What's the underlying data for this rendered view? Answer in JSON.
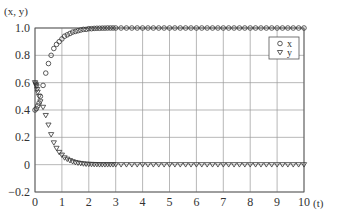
{
  "chart_data": {
    "type": "scatter",
    "title": "",
    "xlabel": "(t)",
    "ylabel": "(x, y)",
    "xlim": [
      0,
      10
    ],
    "ylim": [
      -0.2,
      1.0
    ],
    "grid": true,
    "legend_position": "upper right",
    "x_ticks": [
      "0",
      "1",
      "2",
      "3",
      "4",
      "5",
      "6",
      "7",
      "8",
      "9",
      "10"
    ],
    "y_ticks": [
      "-0.2",
      "0",
      "0.2",
      "0.4",
      "0.6",
      "0.8",
      "1.0"
    ],
    "series": [
      {
        "name": "x",
        "marker": "circle",
        "x": [
          0,
          0.05,
          0.1,
          0.15,
          0.2,
          0.3,
          0.4,
          0.5,
          0.6,
          0.7,
          0.8,
          0.9,
          1.0,
          1.1,
          1.2,
          1.3,
          1.4,
          1.5,
          1.6,
          1.7,
          1.8,
          1.9,
          2.0,
          2.1,
          2.2,
          2.3,
          2.4,
          2.5,
          2.6,
          2.7,
          2.8,
          2.9,
          3.0,
          3.2,
          3.4,
          3.6,
          3.8,
          4.0,
          4.2,
          4.4,
          4.6,
          4.8,
          5.0,
          5.2,
          5.4,
          5.6,
          5.8,
          6.0,
          6.2,
          6.4,
          6.6,
          6.8,
          7.0,
          7.2,
          7.4,
          7.6,
          7.8,
          8.0,
          8.2,
          8.4,
          8.6,
          8.8,
          9.0,
          9.2,
          9.4,
          9.6,
          9.8,
          10.0
        ],
        "values": [
          0.4,
          0.41,
          0.43,
          0.45,
          0.5,
          0.58,
          0.67,
          0.74,
          0.8,
          0.85,
          0.88,
          0.9,
          0.92,
          0.94,
          0.95,
          0.96,
          0.97,
          0.975,
          0.98,
          0.985,
          0.99,
          0.99,
          0.995,
          0.995,
          0.997,
          0.998,
          0.998,
          0.999,
          0.999,
          1.0,
          1.0,
          1.0,
          1.0,
          1.0,
          1.0,
          1.0,
          1.0,
          1.0,
          1.0,
          1.0,
          1.0,
          1.0,
          1.0,
          1.0,
          1.0,
          1.0,
          1.0,
          1.0,
          1.0,
          1.0,
          1.0,
          1.0,
          1.0,
          1.0,
          1.0,
          1.0,
          1.0,
          1.0,
          1.0,
          1.0,
          1.0,
          1.0,
          1.0,
          1.0,
          1.0,
          1.0,
          1.0,
          1.0
        ]
      },
      {
        "name": "y",
        "marker": "triangle-down",
        "x": [
          0,
          0.02,
          0.04,
          0.06,
          0.08,
          0.1,
          0.15,
          0.2,
          0.3,
          0.4,
          0.5,
          0.6,
          0.7,
          0.8,
          0.9,
          1.0,
          1.1,
          1.2,
          1.3,
          1.4,
          1.5,
          1.6,
          1.7,
          1.8,
          1.9,
          2.0,
          2.1,
          2.2,
          2.3,
          2.4,
          2.5,
          2.6,
          2.7,
          2.8,
          2.9,
          3.0,
          3.2,
          3.4,
          3.6,
          3.8,
          4.0,
          4.2,
          4.4,
          4.6,
          4.8,
          5.0,
          5.2,
          5.4,
          5.6,
          5.8,
          6.0,
          6.2,
          6.4,
          6.6,
          6.8,
          7.0,
          7.2,
          7.4,
          7.6,
          7.8,
          8.0,
          8.2,
          8.4,
          8.6,
          8.8,
          9.0,
          9.2,
          9.4,
          9.6,
          9.8,
          10.0
        ],
        "values": [
          0.6,
          0.59,
          0.58,
          0.57,
          0.55,
          0.53,
          0.5,
          0.46,
          0.42,
          0.36,
          0.29,
          0.22,
          0.16,
          0.12,
          0.09,
          0.07,
          0.05,
          0.04,
          0.03,
          0.022,
          0.016,
          0.012,
          0.009,
          0.006,
          0.004,
          0.003,
          0.002,
          0.0015,
          0.001,
          0.0,
          0.0,
          0.0,
          0.0,
          0.0,
          0.0,
          0.0,
          0.0,
          0.0,
          0.0,
          0.0,
          0.0,
          0.0,
          0.0,
          0.0,
          0.0,
          0.0,
          0.0,
          0.0,
          0.0,
          0.0,
          0.0,
          0.0,
          0.0,
          0.0,
          0.0,
          0.0,
          0.0,
          0.0,
          0.0,
          0.0,
          0.0,
          0.0,
          0.0,
          0.0,
          0.0,
          0.0,
          0.0,
          0.0,
          0.0,
          0.0,
          0.0
        ]
      }
    ]
  },
  "legend": {
    "items": [
      {
        "label": "x",
        "marker": "circle"
      },
      {
        "label": "y",
        "marker": "triangle-down"
      }
    ]
  },
  "axes": {
    "x_label": "(t)",
    "y_label": "(x, y)"
  },
  "colors": {
    "marker_stroke": "#333333",
    "grid": "#9a9a9a",
    "frame": "#555555"
  }
}
